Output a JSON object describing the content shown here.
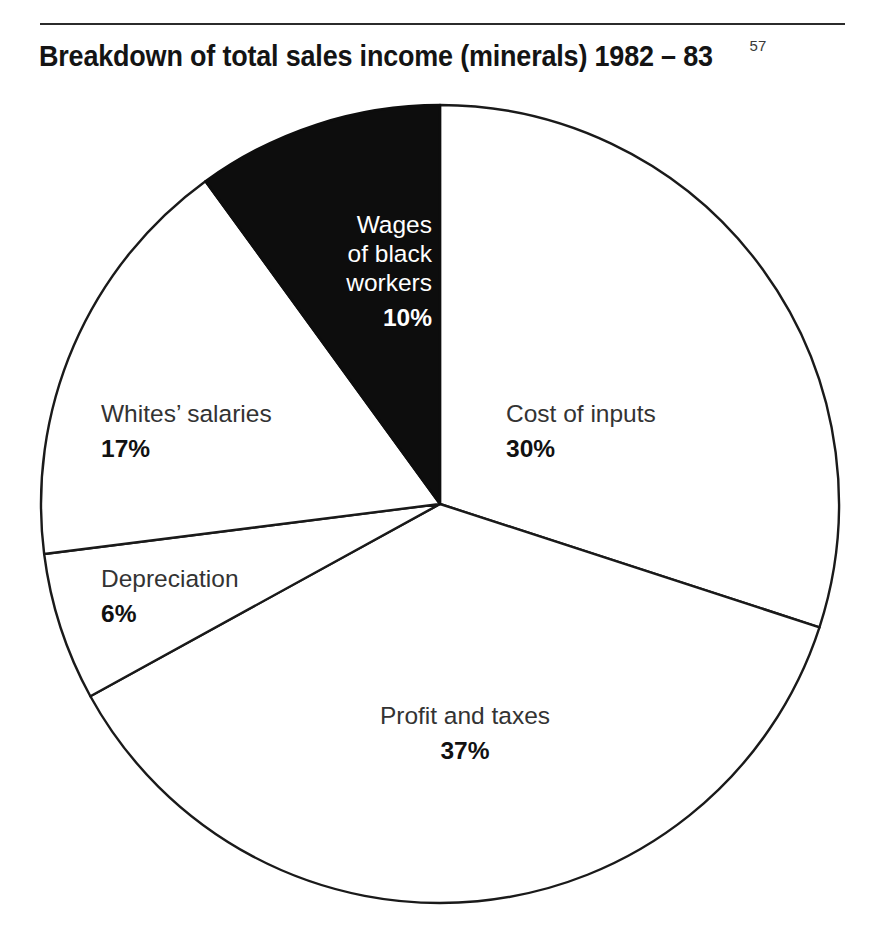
{
  "figure": {
    "title": "Breakdown of total sales income (minerals) 1982 – 83",
    "footnote_marker": "57"
  },
  "chart_data": {
    "type": "pie",
    "title": "Breakdown of total sales income (minerals) 1982 – 83",
    "xlabel": "",
    "ylabel": "",
    "units": "percent of total sales income",
    "start_angle_deg": 0,
    "direction": "clockwise",
    "legend": "none (labels placed on/next to slices)",
    "categories": [
      "Cost of inputs",
      "Profit and taxes",
      "Depreciation",
      "Whites’ salaries",
      "Wages of black workers"
    ],
    "values": [
      30,
      37,
      6,
      17,
      10
    ],
    "slices": [
      {
        "label": "Cost of inputs",
        "value": 30,
        "value_text": "30%",
        "fill": "#ffffff",
        "stroke": "#1a1a1a",
        "label_color": "#333333",
        "start_deg": 0,
        "end_deg": 108
      },
      {
        "label": "Profit and taxes",
        "value": 37,
        "value_text": "37%",
        "fill": "#ffffff",
        "stroke": "#1a1a1a",
        "label_color": "#333333",
        "start_deg": 108,
        "end_deg": 241.2
      },
      {
        "label": "Depreciation",
        "value": 6,
        "value_text": "6%",
        "fill": "#ffffff",
        "stroke": "#1a1a1a",
        "label_color": "#333333",
        "start_deg": 241.2,
        "end_deg": 262.8
      },
      {
        "label": "Whites’ salaries",
        "value": 17,
        "value_text": "17%",
        "fill": "#ffffff",
        "stroke": "#1a1a1a",
        "label_color": "#333333",
        "start_deg": 262.8,
        "end_deg": 324
      },
      {
        "label": "Wages of black workers",
        "label_lines": [
          "Wages",
          "of black",
          "workers"
        ],
        "value": 10,
        "value_text": "10%",
        "fill": "#0d0d0d",
        "stroke": "#0d0d0d",
        "label_color": "#ffffff",
        "start_deg": 324,
        "end_deg": 360
      }
    ],
    "total": 100
  },
  "colors": {
    "ink": "#1a1a1a",
    "highlight_slice": "#0d0d0d",
    "background": "#ffffff",
    "label_grey": "#333333"
  }
}
